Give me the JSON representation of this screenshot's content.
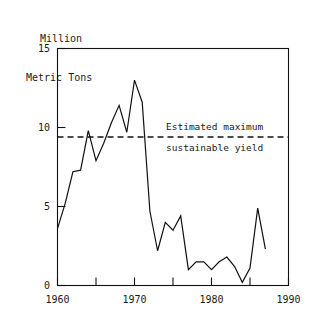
{
  "chart_data": {
    "type": "line",
    "title": "",
    "ylabel": "Million\nMetric Tons",
    "ylabel_line1": "Million",
    "ylabel_line2": "Metric Tons",
    "xlabel": "",
    "xlim": [
      1960,
      1990
    ],
    "ylim": [
      0,
      15
    ],
    "xticks": [
      1960,
      1965,
      1970,
      1975,
      1980,
      1985,
      1990
    ],
    "xtick_labels": [
      "1960",
      "",
      "1970",
      "",
      "1980",
      "",
      "1990"
    ],
    "yticks": [
      0,
      5,
      10,
      15
    ],
    "ytick_labels": [
      "0",
      "5",
      "10",
      "15"
    ],
    "grid": false,
    "legend": "none",
    "series": [
      {
        "name": "Catch",
        "x": [
          1960,
          1961,
          1962,
          1963,
          1964,
          1965,
          1966,
          1967,
          1968,
          1969,
          1970,
          1971,
          1972,
          1973,
          1974,
          1975,
          1976,
          1977,
          1978,
          1979,
          1980,
          1981,
          1982,
          1983,
          1984,
          1985,
          1986,
          1987
        ],
        "values": [
          3.6,
          5.2,
          7.2,
          7.3,
          9.8,
          7.9,
          9.0,
          10.3,
          11.4,
          9.7,
          13.0,
          11.6,
          4.7,
          2.2,
          4.0,
          3.5,
          4.4,
          1.0,
          1.5,
          1.5,
          1.0,
          1.5,
          1.8,
          1.2,
          0.2,
          1.1,
          4.9,
          2.3
        ]
      }
    ],
    "annotations": [
      {
        "name": "estimated-maximum-sustainable-yield",
        "value": 9.4,
        "line_style": "dashed",
        "label_line1": "Estimated maximum",
        "label_line2": "sustainable yield"
      }
    ],
    "colors": {
      "line": "#111111",
      "reference_line": "#111111",
      "axis": "#111111",
      "background": "#ffffff"
    }
  }
}
